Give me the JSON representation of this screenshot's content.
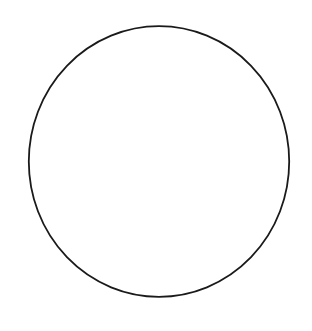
{
  "diagram": {
    "background": "#ffffff",
    "shapes": [
      {
        "type": "ellipse",
        "cx": 159,
        "cy": 161.5,
        "rx": 130.2,
        "ry": 135.3,
        "stroke": "#1a1a1a",
        "stroke_width": 1.8,
        "fill": "none"
      }
    ]
  }
}
